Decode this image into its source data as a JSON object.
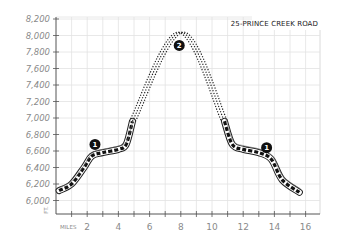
{
  "chart_data": {
    "type": "line",
    "title": "25-PRINCE CREEK ROAD",
    "xlabel": "MILES",
    "ylabel": "FT.",
    "x_ticks": [
      2,
      4,
      6,
      8,
      10,
      12,
      14,
      16
    ],
    "x_tick_labels": [
      "2",
      "4",
      "6",
      "8",
      "10",
      "12",
      "14",
      "16"
    ],
    "y_ticks": [
      6000,
      6200,
      6400,
      6600,
      6800,
      7000,
      7200,
      7400,
      7600,
      7800,
      8000,
      8200
    ],
    "y_tick_labels": [
      "6,000",
      "6,200",
      "6,400",
      "6,600",
      "6,800",
      "7,000",
      "7,200",
      "7,400",
      "7,600",
      "7,800",
      "8,000",
      "8,200"
    ],
    "xlim": [
      0,
      17
    ],
    "ylim": [
      5850,
      8200
    ],
    "grid": true,
    "series": [
      {
        "name": "road (outbound)",
        "style": "dashed-road",
        "x": [
          0.2,
          1.0,
          1.8,
          2.3,
          3.0,
          4.0,
          4.5,
          4.9
        ],
        "y": [
          6120,
          6200,
          6400,
          6540,
          6580,
          6620,
          6680,
          6960
        ]
      },
      {
        "name": "trail (climb & descent)",
        "style": "dotted-trail",
        "x": [
          4.9,
          8.0,
          10.8
        ],
        "y": [
          6960,
          8040,
          6960
        ]
      },
      {
        "name": "road (return)",
        "style": "dashed-road",
        "x": [
          10.8,
          11.3,
          12.0,
          13.0,
          13.8,
          14.5,
          15.6
        ],
        "y": [
          6960,
          6680,
          6620,
          6580,
          6500,
          6250,
          6100
        ]
      }
    ],
    "annotations": [
      {
        "label": "1",
        "x": 2.5,
        "y": 6680
      },
      {
        "label": "2",
        "x": 7.9,
        "y": 7880
      },
      {
        "label": "1",
        "x": 13.5,
        "y": 6640
      }
    ]
  }
}
